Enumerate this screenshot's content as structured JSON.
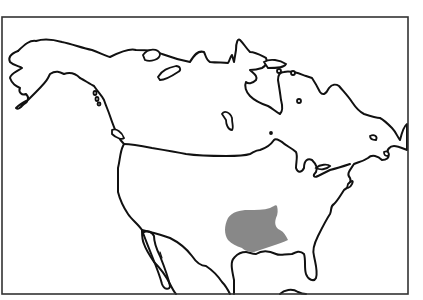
{
  "map": {
    "title": "",
    "subject": "North America outline map",
    "frame": {
      "x": 2,
      "y": 17,
      "width": 406,
      "height": 277,
      "stroke": "#333333"
    },
    "colors": {
      "background": "#ffffff",
      "outline": "#111111",
      "highlight_region": "#888888"
    },
    "highlighted_region": {
      "description": "Shaded range in south-central United States",
      "fill": "#888888"
    },
    "features": [
      "coastline",
      "lakes",
      "islands",
      "highlighted-range"
    ]
  }
}
